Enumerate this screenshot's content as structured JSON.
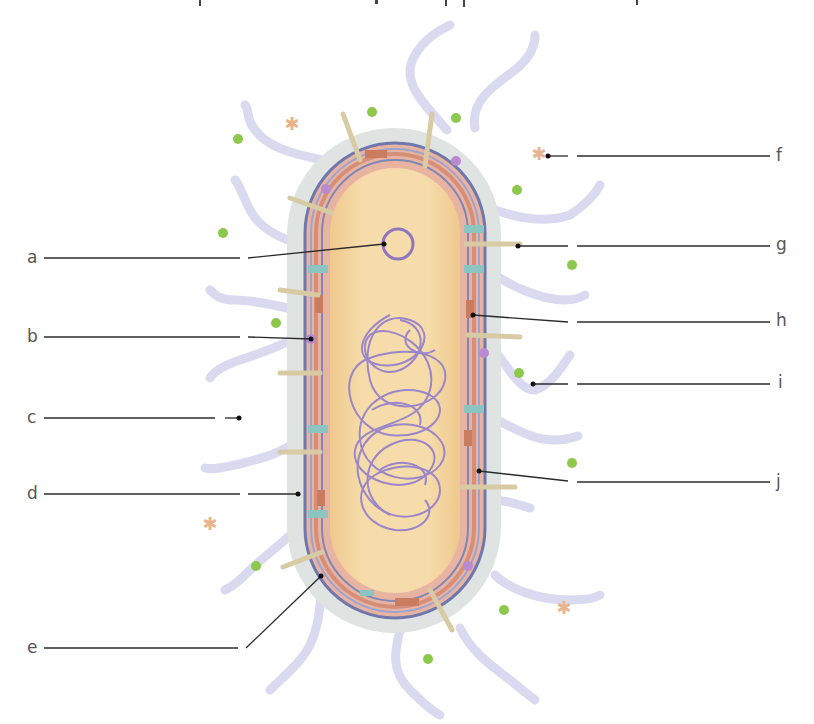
{
  "diagram": {
    "colors": {
      "cytoplasm": "#f3d9a3",
      "cytoplasm_edge": "#e8c488",
      "capsule": "#dfe3e2",
      "membrane_pink": "#e8b3a3",
      "membrane_blue": "#7d87b8",
      "membrane_teal": "#8cc5c0",
      "membrane_protein": "#c97d5e",
      "nucleoid": "#9a86c8",
      "plasmid": "#8d78c0",
      "flagella": "#d9d8f0",
      "pili": "#d8cba4",
      "green_particle": "#8cc84b",
      "orange_particle": "#e8b48f",
      "purple_dot": "#b88ad0",
      "leader_line": "#2b2b2b"
    },
    "left_labels": [
      {
        "letter": "a",
        "y": 258
      },
      {
        "letter": "b",
        "y": 337
      },
      {
        "letter": "c",
        "y": 418
      },
      {
        "letter": "d",
        "y": 494
      },
      {
        "letter": "e",
        "y": 648
      }
    ],
    "right_labels": [
      {
        "letter": "f",
        "y": 156
      },
      {
        "letter": "g",
        "y": 246
      },
      {
        "letter": "h",
        "y": 321
      },
      {
        "letter": "i",
        "y": 383
      },
      {
        "letter": "j",
        "y": 483
      }
    ]
  }
}
